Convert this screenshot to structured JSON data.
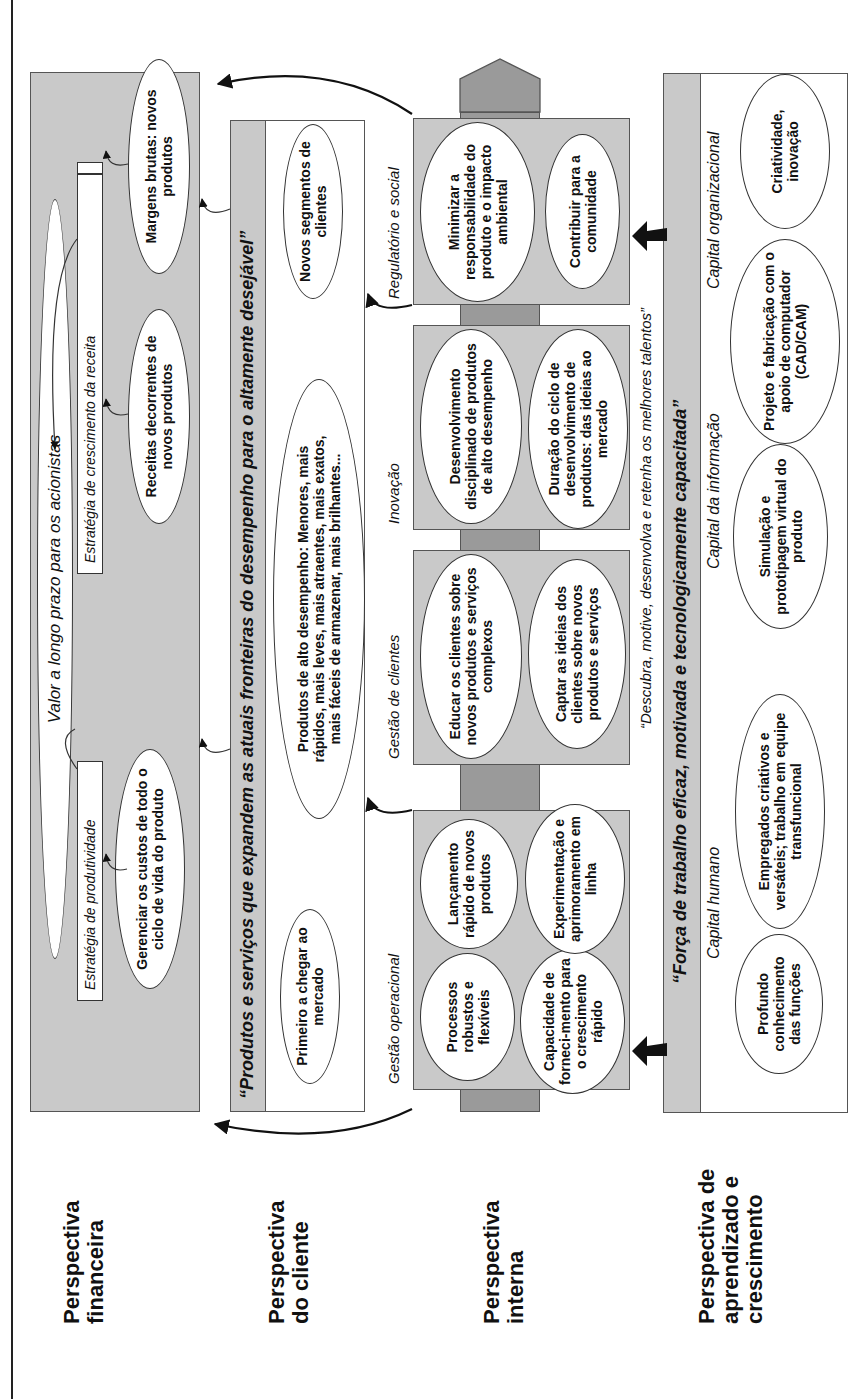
{
  "perspectives": {
    "financial": "Perspectiva financeira",
    "client": "Perspectiva do cliente",
    "internal": "Perspectiva interna",
    "learning": "Perspectiva de aprendizado e crescimento"
  },
  "financial": {
    "goal": "Valor a longo prazo para os acionistas",
    "productivity_strategy": "Estratégia de produtividade",
    "growth_strategy": "Estratégia de crescimento da receita",
    "productivity_items": [
      "Gerenciar os custos de todo o ciclo de vida do produto"
    ],
    "growth_items": [
      "Receitas decorrentes de novos produtos",
      "Margens brutas: novos produtos"
    ]
  },
  "client": {
    "value_proposition": "“Produtos e serviços que expandem as atuais fronteiras do desempenho para o altamente desejável”",
    "items": [
      "Primeiro a chegar ao mercado",
      "Produtos de alto desempenho: Menores, mais rápidos, mais leves, mais atraentes, mais exatos, mais fáceis de armazenar, mais brilhantes...",
      "Novos segmentos de clientes"
    ]
  },
  "internal": {
    "groups": [
      {
        "title": "Gestão operacional",
        "items": [
          "Processos robustos e flexíveis",
          "Capacidade de forneci-mento para o crescimento rápido",
          "Lançamento rápido de novos produtos",
          "Experimentação e aprimoramento em linha"
        ]
      },
      {
        "title": "Gestão de clientes",
        "items": [
          "Educar os clientes sobre novos produtos e serviços complexos",
          "Captar as ideias dos clientes sobre novos produtos e serviços"
        ]
      },
      {
        "title": "Inovação",
        "items": [
          "Desenvolvimento disciplinado de produtos de alto desempenho",
          "Duração do ciclo de desenvolvimento de produtos: das ideias ao mercado"
        ]
      },
      {
        "title": "Regulatório e social",
        "items": [
          "Minimizar a responsabilidade do produto e o impacto ambiental",
          "Contribuir para a comunidade"
        ]
      }
    ],
    "talent_quote": "“Descubra, motive, desenvolva e retenha os melhores talentos”"
  },
  "learning": {
    "workforce_quote": "“Força de trabalho eficaz, motivada e tecnologicamente capacitada”",
    "groups": [
      {
        "title": "Capital humano",
        "items": [
          "Profundo conhecimento das funções",
          "Empregados criativos e versáteis; trabalho em equipe transfuncional"
        ]
      },
      {
        "title": "Capital da informação",
        "items": [
          "Simulação e prototipagem virtual do produto",
          "Projeto e fabricação com o apoio de computador (CAD/CAM)"
        ]
      },
      {
        "title": "Capital organizacional",
        "items": [
          "Criatividade, inovação"
        ]
      }
    ]
  },
  "colors": {
    "box_gray": "#c9c9c9",
    "spine_gray": "#9a9a9a",
    "line": "#333333"
  }
}
